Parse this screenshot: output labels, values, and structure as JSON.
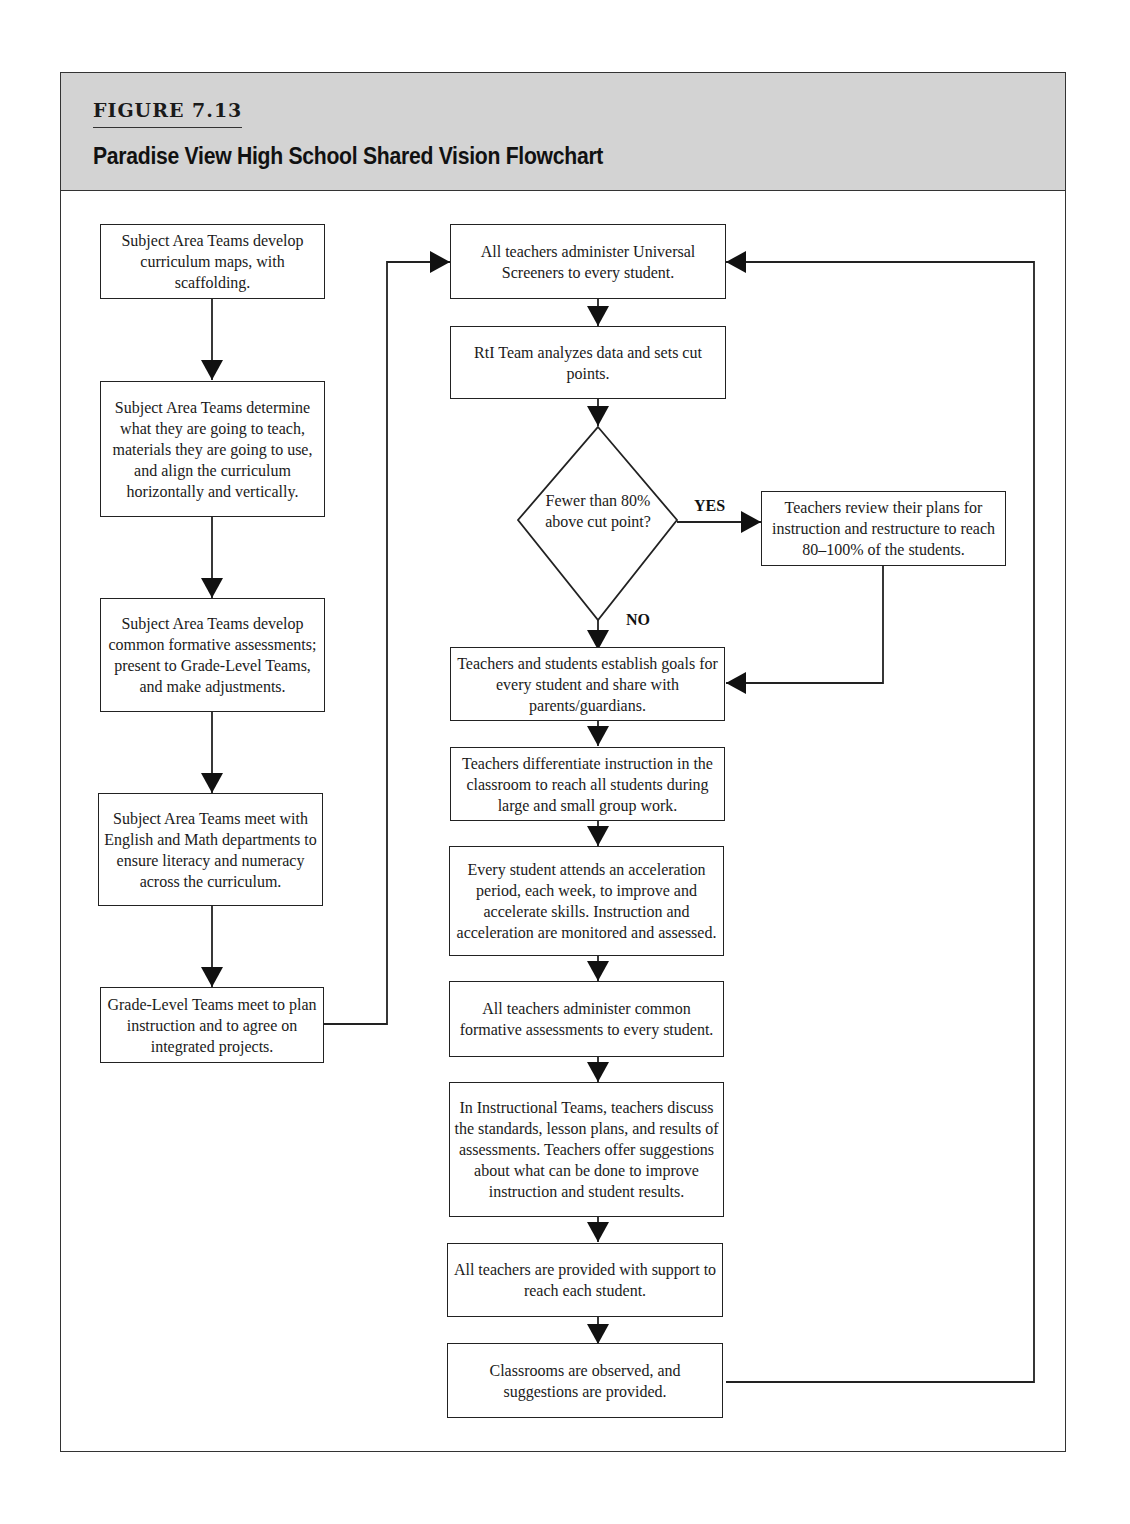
{
  "figure": {
    "label": "FIGURE 7.13",
    "title": "Paradise View High School Shared Vision Flowchart"
  },
  "left_column": [
    {
      "id": "L1",
      "text": "Subject Area Teams develop curriculum maps, with scaffolding."
    },
    {
      "id": "L2",
      "text": "Subject Area Teams determine what they are going to teach, materials they are going to use, and align the curriculum horizontally and vertically."
    },
    {
      "id": "L3",
      "text": "Subject Area Teams develop common formative assessments; present to Grade-Level Teams, and make adjustments."
    },
    {
      "id": "L4",
      "text": "Subject Area Teams meet with English and Math departments to ensure literacy and numeracy across the curriculum."
    },
    {
      "id": "L5",
      "text": "Grade-Level Teams meet to plan instruction and to agree on integrated projects."
    }
  ],
  "main_column": [
    {
      "id": "M1",
      "text": "All teachers administer Universal Screeners to every student."
    },
    {
      "id": "M2",
      "text": "RtI Team analyzes data and sets cut points."
    },
    {
      "id": "M3",
      "text": "Teachers and students establish goals for every student and share with parents/guardians."
    },
    {
      "id": "M4",
      "text": "Teachers differentiate instruction in the classroom to reach all students during large and small group work."
    },
    {
      "id": "M5",
      "text": "Every student attends an acceleration period, each week, to improve and accelerate skills. Instruction and acceleration are monitored and assessed."
    },
    {
      "id": "M6",
      "text": "All teachers administer common formative assessments to every student."
    },
    {
      "id": "M7",
      "text": "In Instructional Teams, teachers discuss the standards, lesson plans, and results of assessments. Teachers offer suggestions about what can be done to improve instruction and student results."
    },
    {
      "id": "M8",
      "text": "All teachers are provided with support to reach each student."
    },
    {
      "id": "M9",
      "text": "Classrooms are observed, and suggestions are provided."
    }
  ],
  "decision": {
    "text": "Fewer than 80% above cut point?",
    "yes_label": "YES",
    "no_label": "NO"
  },
  "side_box": {
    "id": "S1",
    "text": "Teachers review their plans for instruction and restructure to reach 80–100% of the students."
  },
  "connections": [
    [
      "L1",
      "L2"
    ],
    [
      "L2",
      "L3"
    ],
    [
      "L3",
      "L4"
    ],
    [
      "L4",
      "L5"
    ],
    [
      "L5",
      "M1"
    ],
    [
      "M1",
      "M2"
    ],
    [
      "M2",
      "decision"
    ],
    [
      "decision",
      "S1",
      "YES"
    ],
    [
      "decision",
      "M3",
      "NO"
    ],
    [
      "S1",
      "M3"
    ],
    [
      "M3",
      "M4"
    ],
    [
      "M4",
      "M5"
    ],
    [
      "M5",
      "M6"
    ],
    [
      "M6",
      "M7"
    ],
    [
      "M7",
      "M8"
    ],
    [
      "M8",
      "M9"
    ],
    [
      "M9",
      "M1"
    ]
  ],
  "colors": {
    "header_bg": "#d3d3d3",
    "line": "#222222"
  }
}
